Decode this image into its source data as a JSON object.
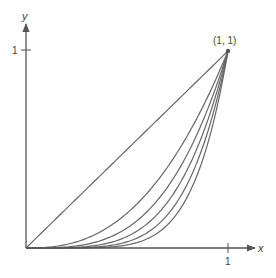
{
  "chart_data": {
    "type": "line",
    "title": "",
    "xlabel": "x",
    "ylabel": "y",
    "xlim": [
      0,
      1.13
    ],
    "ylim": [
      0,
      1.13
    ],
    "grid": false,
    "legend": null,
    "x_ticks": [
      {
        "value": 1,
        "label": "1"
      }
    ],
    "y_ticks": [
      {
        "value": 1,
        "label": "1"
      }
    ],
    "annotations": [
      {
        "text": "(1, 1)",
        "x": 1,
        "y": 1
      }
    ],
    "series": [
      {
        "name": "curve-1",
        "exponent": 1,
        "values": [
          [
            0,
            0
          ],
          [
            1,
            1
          ]
        ]
      },
      {
        "name": "curve-2",
        "exponent": 2.5
      },
      {
        "name": "curve-3",
        "exponent": 3.3
      },
      {
        "name": "curve-4",
        "exponent": 4.1
      },
      {
        "name": "curve-5",
        "exponent": 5
      },
      {
        "name": "curve-6",
        "exponent": 6
      }
    ]
  },
  "colors": {
    "curve": "#666666",
    "axis": "#555555",
    "point": "#555555"
  }
}
